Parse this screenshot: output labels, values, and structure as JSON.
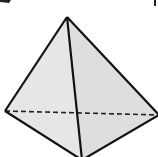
{
  "diagram": {
    "type": "geometry-solid",
    "colors": {
      "background": "#ffffff",
      "face_fill": "#e3e3e3",
      "edge": "#111111"
    },
    "vertices": {
      "apex": [
        67,
        17
      ],
      "left": [
        5,
        111
      ],
      "right": [
        159,
        115
      ],
      "bottom": [
        82,
        160
      ]
    },
    "edges": {
      "visible": [
        [
          "apex",
          "left"
        ],
        [
          "apex",
          "right"
        ],
        [
          "apex",
          "bottom"
        ],
        [
          "left",
          "bottom"
        ],
        [
          "right",
          "bottom"
        ]
      ],
      "hidden": [
        [
          "left",
          "right"
        ]
      ]
    }
  }
}
